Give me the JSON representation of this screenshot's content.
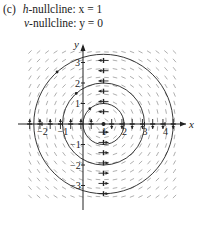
{
  "caption": {
    "label": "(c)",
    "line1_var": "h",
    "line1_text": "-nullcline: x = 1",
    "line2_var": "v",
    "line2_text": "-nullcline: y = 0"
  },
  "chart_data": {
    "type": "phase-portrait",
    "title": "",
    "xlabel": "x",
    "ylabel": "y",
    "x_ticks": [
      -2,
      -1,
      1,
      2,
      3,
      4
    ],
    "y_ticks": [
      -3,
      -2,
      -1,
      1,
      2,
      3
    ],
    "xlim": [
      -2.7,
      4.4
    ],
    "ylim": [
      -3.6,
      3.6
    ],
    "equilibrium": {
      "x": 1,
      "y": 0
    },
    "nullclines": [
      {
        "name": "h-nullcline",
        "equation": "x = 1",
        "orientation": "vertical"
      },
      {
        "name": "v-nullcline",
        "equation": "y = 0",
        "orientation": "horizontal"
      }
    ],
    "solution_curves": [
      {
        "type": "circle",
        "center": [
          1,
          0
        ],
        "radius": 1,
        "direction": "counterclockwise"
      },
      {
        "type": "circle",
        "center": [
          1,
          0
        ],
        "radius": 2,
        "direction": "counterclockwise"
      },
      {
        "type": "circle",
        "center": [
          1,
          0
        ],
        "radius": 3.4,
        "direction": "counterclockwise"
      }
    ],
    "grid": false,
    "direction_field": true
  },
  "colors": {
    "ink": "#222222",
    "field": "#9a9a9a"
  }
}
